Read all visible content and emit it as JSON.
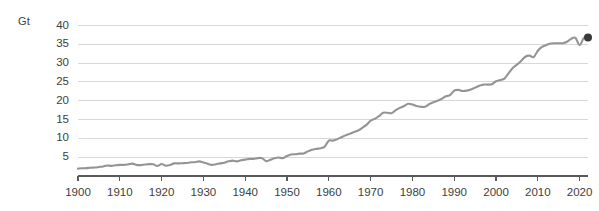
{
  "chart_data": {
    "type": "line",
    "title": "",
    "subtitle": "",
    "xlabel": "",
    "ylabel": "Gt",
    "unit_label": "Gt",
    "xlim": [
      1900,
      2022
    ],
    "ylim": [
      0,
      42
    ],
    "grid": true,
    "legend": false,
    "legend_position": "none",
    "line_color": "#949494",
    "marker_color": "#3a3a3a",
    "grid_color": "#d8d8d8",
    "axis_color": "#5a5a5a",
    "text_color": "#3d3d3d",
    "ytick_labels": [
      "5",
      "10",
      "15",
      "20",
      "25",
      "30",
      "35",
      "40"
    ],
    "ytick_values": [
      5,
      10,
      15,
      20,
      25,
      30,
      35,
      40
    ],
    "xtick_labels": [
      "1900",
      "1910",
      "1920",
      "1930",
      "1940",
      "1950",
      "1960",
      "1970",
      "1980",
      "1990",
      "2000",
      "2010",
      "2020"
    ],
    "xtick_values": [
      1900,
      1910,
      1920,
      1930,
      1940,
      1950,
      1960,
      1970,
      1980,
      1990,
      2000,
      2010,
      2020
    ],
    "x": [
      1900,
      1901,
      1902,
      1903,
      1904,
      1905,
      1906,
      1907,
      1908,
      1909,
      1910,
      1911,
      1912,
      1913,
      1914,
      1915,
      1916,
      1917,
      1918,
      1919,
      1920,
      1921,
      1922,
      1923,
      1924,
      1925,
      1926,
      1927,
      1928,
      1929,
      1930,
      1931,
      1932,
      1933,
      1934,
      1935,
      1936,
      1937,
      1938,
      1939,
      1940,
      1941,
      1942,
      1943,
      1944,
      1945,
      1946,
      1947,
      1948,
      1949,
      1950,
      1951,
      1952,
      1953,
      1954,
      1955,
      1956,
      1957,
      1958,
      1959,
      1960,
      1961,
      1962,
      1963,
      1964,
      1965,
      1966,
      1967,
      1968,
      1969,
      1970,
      1971,
      1972,
      1973,
      1974,
      1975,
      1976,
      1977,
      1978,
      1979,
      1980,
      1981,
      1982,
      1983,
      1984,
      1985,
      1986,
      1987,
      1988,
      1989,
      1990,
      1991,
      1992,
      1993,
      1994,
      1995,
      1996,
      1997,
      1998,
      1999,
      2000,
      2001,
      2002,
      2003,
      2004,
      2005,
      2006,
      2007,
      2008,
      2009,
      2010,
      2011,
      2012,
      2013,
      2014,
      2015,
      2016,
      2017,
      2018,
      2019,
      2020,
      2021,
      2022
    ],
    "values": [
      1.95,
      2.05,
      2.1,
      2.2,
      2.25,
      2.4,
      2.55,
      2.8,
      2.7,
      2.85,
      2.95,
      2.95,
      3.1,
      3.3,
      2.95,
      2.9,
      3.05,
      3.15,
      3.1,
      2.65,
      3.2,
      2.75,
      2.9,
      3.35,
      3.35,
      3.4,
      3.45,
      3.65,
      3.65,
      3.9,
      3.6,
      3.25,
      2.95,
      3.1,
      3.35,
      3.55,
      3.9,
      4.1,
      3.9,
      4.2,
      4.35,
      4.55,
      4.55,
      4.75,
      4.75,
      3.95,
      4.3,
      4.7,
      4.9,
      4.75,
      5.3,
      5.7,
      5.8,
      5.95,
      6.0,
      6.55,
      6.95,
      7.2,
      7.4,
      7.8,
      9.4,
      9.4,
      9.8,
      10.3,
      10.8,
      11.2,
      11.7,
      12.1,
      12.8,
      13.6,
      14.7,
      15.2,
      15.9,
      16.8,
      16.8,
      16.7,
      17.5,
      18.1,
      18.6,
      19.2,
      19.0,
      18.6,
      18.4,
      18.4,
      19.1,
      19.6,
      20.0,
      20.5,
      21.2,
      21.5,
      22.7,
      22.9,
      22.6,
      22.7,
      23.0,
      23.5,
      24.0,
      24.3,
      24.3,
      24.4,
      25.2,
      25.5,
      25.9,
      27.3,
      28.7,
      29.6,
      30.6,
      31.7,
      32.0,
      31.6,
      33.3,
      34.3,
      34.8,
      35.2,
      35.3,
      35.3,
      35.3,
      35.7,
      36.5,
      36.7,
      34.8,
      36.7,
      36.8
    ],
    "end_marker": {
      "x": 2022,
      "y": 36.8,
      "show": true
    }
  }
}
